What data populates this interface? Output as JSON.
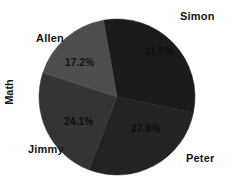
{
  "chart_data": {
    "type": "pie",
    "title": "",
    "xlabel": "",
    "ylabel": "Math",
    "categories": [
      "Simon",
      "Peter",
      "Jimmy",
      "Allen"
    ],
    "values": [
      31.0,
      27.6,
      24.1,
      17.2
    ],
    "labels": [
      "31.0%",
      "27.6%",
      "24.1%",
      "17.2%"
    ],
    "colors": [
      "#1b1b1b",
      "#232323",
      "#343434",
      "#4d4d4d"
    ],
    "legend": "none",
    "grid": false,
    "startangle": -10,
    "direction": "clockwise",
    "slices": [
      {
        "name": "Simon",
        "value": 31.0,
        "label": "31.0%",
        "color": "#1b1b1b"
      },
      {
        "name": "Peter",
        "value": 27.6,
        "label": "27.6%",
        "color": "#232323"
      },
      {
        "name": "Jimmy",
        "value": 24.1,
        "label": "24.1%",
        "color": "#343434"
      },
      {
        "name": "Allen",
        "value": 17.2,
        "label": "17.2%",
        "color": "#4d4d4d"
      }
    ]
  },
  "axis": {
    "ylabel": "Math"
  },
  "names": {
    "simon": "Simon",
    "peter": "Peter",
    "jimmy": "Jimmy",
    "allen": "Allen"
  },
  "percents": {
    "simon": "31.0%",
    "peter": "27.6%",
    "jimmy": "24.1%",
    "allen": "17.2%"
  }
}
